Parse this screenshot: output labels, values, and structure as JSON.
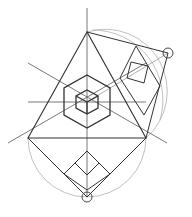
{
  "diagram": {
    "colors": {
      "background": "#ffffff",
      "main_line": "#333333",
      "thin_line": "#555555",
      "construction_arc": "#aaaaaa"
    },
    "points": {
      "top": [
        87,
        32
      ],
      "left": [
        28,
        138
      ],
      "right": [
        146,
        138
      ],
      "center": [
        87,
        102
      ],
      "axis_top": [
        87,
        8
      ],
      "right_marker": [
        168,
        53
      ],
      "bottom_marker": [
        87,
        197
      ]
    }
  }
}
